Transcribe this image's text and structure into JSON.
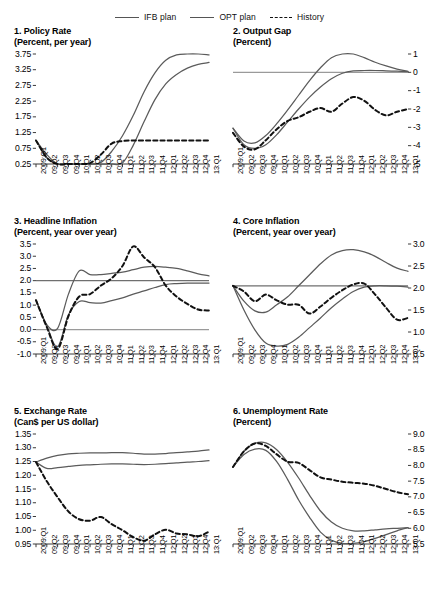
{
  "legend": {
    "items": [
      {
        "label": "IFB plan",
        "style": "solid"
      },
      {
        "label": "OPT plan",
        "style": "solid"
      },
      {
        "label": "History",
        "style": "dashed"
      }
    ]
  },
  "x_categories": [
    "2009:Q1",
    "09:Q2",
    "09:Q3",
    "09:Q4",
    "10:Q1",
    "10:Q2",
    "10:Q3",
    "10:Q4",
    "11:Q1",
    "11:Q2",
    "11:Q3",
    "11:Q4",
    "12:Q1",
    "12:Q2",
    "12:Q3",
    "12:Q4",
    "13:Q1"
  ],
  "chart_data": [
    {
      "type": "line",
      "panel": 1,
      "title": "1. Policy Rate",
      "subtitle": "(Percent, per year)",
      "xlabel": "",
      "ylabel": "",
      "axis_side": "left",
      "ylim": [
        0.25,
        3.75
      ],
      "yticks": [
        "0.25",
        "0.75",
        "1.25",
        "1.75",
        "2.25",
        "2.75",
        "3.25",
        "3.75"
      ],
      "ytick_values": [
        0.25,
        0.75,
        1.25,
        1.75,
        2.25,
        2.75,
        3.25,
        3.75
      ],
      "grid": false,
      "categories": [
        "2009:Q1",
        "09:Q2",
        "09:Q3",
        "09:Q4",
        "10:Q1",
        "10:Q2",
        "10:Q3",
        "10:Q4",
        "11:Q1",
        "11:Q2",
        "11:Q3",
        "11:Q4",
        "12:Q1",
        "12:Q2",
        "12:Q3",
        "12:Q4",
        "13:Q1"
      ],
      "series": [
        {
          "name": "IFB plan",
          "style": "solid",
          "values": [
            1.0,
            0.55,
            0.25,
            0.25,
            0.25,
            0.25,
            0.3,
            0.65,
            1.15,
            1.8,
            2.55,
            3.15,
            3.55,
            3.72,
            3.75,
            3.75,
            3.72
          ]
        },
        {
          "name": "OPT plan",
          "style": "solid",
          "values": [
            1.0,
            0.45,
            0.25,
            0.25,
            0.25,
            0.25,
            0.25,
            0.25,
            0.28,
            0.85,
            1.6,
            2.3,
            2.8,
            3.1,
            3.3,
            3.42,
            3.48
          ]
        },
        {
          "name": "History",
          "style": "dashed",
          "values": [
            1.0,
            0.45,
            0.25,
            0.25,
            0.25,
            0.28,
            0.55,
            0.9,
            0.98,
            1.0,
            1.0,
            1.0,
            1.0,
            1.0,
            1.0,
            1.0,
            1.0
          ]
        }
      ]
    },
    {
      "type": "line",
      "panel": 2,
      "title": "2. Output Gap",
      "subtitle": "(Percent)",
      "xlabel": "",
      "ylabel": "",
      "axis_side": "right",
      "ylim": [
        -5,
        1
      ],
      "yticks": [
        "1",
        "0",
        "-1",
        "-2",
        "-3",
        "-4",
        "-5"
      ],
      "ytick_values": [
        1,
        0,
        -1,
        -2,
        -3,
        -4,
        -5
      ],
      "grid": false,
      "zero_line": 0,
      "categories": [
        "2009:Q1",
        "09:Q2",
        "09:Q3",
        "09:Q4",
        "10:Q1",
        "10:Q2",
        "10:Q3",
        "10:Q4",
        "11:Q1",
        "11:Q2",
        "11:Q3",
        "11:Q4",
        "12:Q1",
        "12:Q2",
        "12:Q3",
        "12:Q4",
        "13:Q1"
      ],
      "series": [
        {
          "name": "IFB plan",
          "style": "solid",
          "values": [
            -3.05,
            -3.75,
            -3.85,
            -3.45,
            -2.8,
            -2.05,
            -1.25,
            -0.45,
            0.25,
            0.8,
            1.1,
            1.05,
            0.8,
            0.55,
            0.35,
            0.18,
            0.05
          ]
        },
        {
          "name": "OPT plan",
          "style": "solid",
          "values": [
            -3.05,
            -3.95,
            -4.15,
            -3.95,
            -3.4,
            -2.7,
            -2.0,
            -1.35,
            -0.8,
            -0.35,
            -0.05,
            0.08,
            0.1,
            0.1,
            0.08,
            0.06,
            0.04
          ]
        },
        {
          "name": "History",
          "style": "dashed",
          "values": [
            -3.3,
            -4.05,
            -4.2,
            -3.7,
            -3.1,
            -2.65,
            -2.45,
            -2.15,
            -1.95,
            -2.15,
            -1.7,
            -1.35,
            -1.55,
            -2.05,
            -2.35,
            -2.15,
            -2.0
          ]
        }
      ]
    },
    {
      "type": "line",
      "panel": 3,
      "title": "3. Headline Inflation",
      "subtitle": "(Percent, year over year)",
      "xlabel": "",
      "ylabel": "",
      "axis_side": "left",
      "ylim": [
        -1.0,
        3.5
      ],
      "yticks": [
        "-1.0",
        "-0.5",
        "0.0",
        "0.5",
        "1.0",
        "1.5",
        "2.0",
        "2.5",
        "3.0",
        "3.5"
      ],
      "ytick_values": [
        -1.0,
        -0.5,
        0.0,
        0.5,
        1.0,
        1.5,
        2.0,
        2.5,
        3.0,
        3.5
      ],
      "grid": false,
      "target_line": 2.0,
      "zero_line": 0.0,
      "categories": [
        "2009:Q1",
        "09:Q2",
        "09:Q3",
        "09:Q4",
        "10:Q1",
        "10:Q2",
        "10:Q3",
        "10:Q4",
        "11:Q1",
        "11:Q2",
        "11:Q3",
        "11:Q4",
        "12:Q1",
        "12:Q2",
        "12:Q3",
        "12:Q4",
        "13:Q1"
      ],
      "series": [
        {
          "name": "IFB plan",
          "style": "solid",
          "values": [
            1.2,
            0.2,
            0.05,
            1.45,
            2.4,
            2.25,
            2.25,
            2.3,
            2.35,
            2.45,
            2.55,
            2.58,
            2.55,
            2.5,
            2.4,
            2.28,
            2.2
          ]
        },
        {
          "name": "OPT plan",
          "style": "solid",
          "values": [
            1.2,
            0.15,
            -0.7,
            0.6,
            1.15,
            1.1,
            1.08,
            1.18,
            1.3,
            1.45,
            1.58,
            1.72,
            1.84,
            1.88,
            1.9,
            1.9,
            1.9
          ]
        },
        {
          "name": "History",
          "style": "dashed",
          "values": [
            1.2,
            0.1,
            -0.8,
            0.55,
            1.35,
            1.45,
            1.8,
            2.1,
            2.6,
            3.4,
            2.95,
            2.55,
            1.8,
            1.35,
            1.05,
            0.82,
            0.78
          ]
        }
      ]
    },
    {
      "type": "line",
      "panel": 4,
      "title": "4. Core Inflation",
      "subtitle": "(Percent, year over year)",
      "xlabel": "",
      "ylabel": "",
      "axis_side": "right",
      "ylim": [
        0.5,
        3.0
      ],
      "yticks": [
        "3.0",
        "2.5",
        "2.0",
        "1.5",
        "1.0",
        "0.5"
      ],
      "ytick_values": [
        3.0,
        2.5,
        2.0,
        1.5,
        1.0,
        0.5
      ],
      "grid": false,
      "target_line": 2.05,
      "categories": [
        "2009:Q1",
        "09:Q2",
        "09:Q3",
        "09:Q4",
        "10:Q1",
        "10:Q2",
        "10:Q3",
        "10:Q4",
        "11:Q1",
        "11:Q2",
        "11:Q3",
        "11:Q4",
        "12:Q1",
        "12:Q2",
        "12:Q3",
        "12:Q4",
        "13:Q1"
      ],
      "series": [
        {
          "name": "IFB plan",
          "style": "solid",
          "values": [
            2.05,
            1.7,
            1.48,
            1.45,
            1.62,
            1.8,
            2.05,
            2.3,
            2.55,
            2.75,
            2.85,
            2.87,
            2.82,
            2.72,
            2.58,
            2.45,
            2.38
          ]
        },
        {
          "name": "OPT plan",
          "style": "solid",
          "values": [
            2.05,
            1.5,
            1.05,
            0.75,
            0.68,
            0.72,
            0.88,
            1.1,
            1.32,
            1.55,
            1.75,
            1.92,
            2.02,
            2.05,
            2.05,
            2.04,
            2.02
          ]
        },
        {
          "name": "History",
          "style": "dashed",
          "values": [
            2.05,
            1.92,
            1.7,
            1.85,
            1.72,
            1.62,
            1.62,
            1.42,
            1.58,
            1.78,
            1.95,
            2.08,
            2.1,
            1.85,
            1.55,
            1.28,
            1.32
          ]
        }
      ]
    },
    {
      "type": "line",
      "panel": 5,
      "title": "5. Exchange Rate",
      "subtitle": "(Can$ per US dollar)",
      "xlabel": "",
      "ylabel": "",
      "axis_side": "left",
      "ylim": [
        0.95,
        1.35
      ],
      "yticks": [
        "0.95",
        "1.00",
        "1.05",
        "1.10",
        "1.15",
        "1.20",
        "1.25",
        "1.30",
        "1.35"
      ],
      "ytick_values": [
        0.95,
        1.0,
        1.05,
        1.1,
        1.15,
        1.2,
        1.25,
        1.3,
        1.35
      ],
      "grid": false,
      "categories": [
        "2009:Q1",
        "09:Q2",
        "09:Q3",
        "09:Q4",
        "10:Q1",
        "10:Q2",
        "10:Q3",
        "10:Q4",
        "11:Q1",
        "11:Q2",
        "11:Q3",
        "11:Q4",
        "12:Q1",
        "12:Q2",
        "12:Q3",
        "12:Q4",
        "13:Q1"
      ],
      "series": [
        {
          "name": "IFB plan",
          "style": "solid",
          "values": [
            1.248,
            1.262,
            1.272,
            1.278,
            1.28,
            1.281,
            1.281,
            1.282,
            1.282,
            1.28,
            1.277,
            1.277,
            1.279,
            1.282,
            1.285,
            1.288,
            1.292
          ]
        },
        {
          "name": "OPT plan",
          "style": "solid",
          "values": [
            1.248,
            1.225,
            1.228,
            1.232,
            1.236,
            1.238,
            1.24,
            1.241,
            1.241,
            1.24,
            1.239,
            1.24,
            1.242,
            1.245,
            1.248,
            1.25,
            1.253
          ]
        },
        {
          "name": "History",
          "style": "dashed",
          "values": [
            1.248,
            1.178,
            1.12,
            1.068,
            1.04,
            1.035,
            1.048,
            1.022,
            1.0,
            0.975,
            0.962,
            0.985,
            1.002,
            0.988,
            0.985,
            0.978,
            0.995
          ]
        }
      ]
    },
    {
      "type": "line",
      "panel": 6,
      "title": "6. Unemployment Rate",
      "subtitle": "(Percent)",
      "xlabel": "",
      "ylabel": "",
      "axis_side": "right",
      "ylim": [
        5.5,
        9.0
      ],
      "yticks": [
        "9.0",
        "8.5",
        "8.0",
        "7.5",
        "7.0",
        "6.5",
        "6.0",
        "5.5"
      ],
      "ytick_values": [
        9.0,
        8.5,
        8.0,
        7.5,
        7.0,
        6.5,
        6.0,
        5.5
      ],
      "grid": false,
      "categories": [
        "2009:Q1",
        "09:Q2",
        "09:Q3",
        "09:Q4",
        "10:Q1",
        "10:Q2",
        "10:Q3",
        "10:Q4",
        "11:Q1",
        "11:Q2",
        "11:Q3",
        "11:Q4",
        "12:Q1",
        "12:Q2",
        "12:Q3",
        "12:Q4",
        "13:Q1"
      ],
      "series": [
        {
          "name": "IFB plan",
          "style": "solid",
          "values": [
            7.95,
            8.45,
            8.7,
            8.72,
            8.5,
            8.1,
            7.6,
            7.05,
            6.55,
            6.2,
            6.0,
            5.92,
            5.92,
            5.95,
            5.98,
            6.0,
            6.02
          ]
        },
        {
          "name": "OPT plan",
          "style": "solid",
          "values": [
            7.95,
            8.35,
            8.52,
            8.48,
            8.12,
            7.55,
            6.9,
            6.35,
            5.88,
            5.62,
            5.52,
            5.52,
            5.58,
            5.68,
            5.8,
            5.92,
            6.02
          ]
        },
        {
          "name": "History",
          "style": "dashed",
          "values": [
            7.95,
            8.45,
            8.7,
            8.62,
            8.35,
            8.12,
            8.08,
            7.85,
            7.62,
            7.55,
            7.48,
            7.45,
            7.42,
            7.35,
            7.25,
            7.15,
            7.08
          ]
        }
      ]
    }
  ]
}
